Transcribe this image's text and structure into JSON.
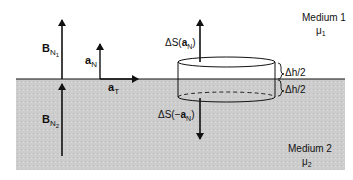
{
  "diagram": {
    "media": {
      "top": {
        "name": "Medium 1",
        "permeability": "μ",
        "subscript": "1"
      },
      "bottom": {
        "name": "Medium 2",
        "permeability": "μ",
        "subscript": "2"
      }
    },
    "vectors": {
      "b_n1": {
        "base": "B",
        "sub": "N",
        "subsub": "1"
      },
      "b_n2": {
        "base": "B",
        "sub": "N",
        "subsub": "2"
      },
      "a_n": {
        "base": "a",
        "sub": "N"
      },
      "a_t": {
        "base": "a",
        "sub": "T"
      },
      "ds_up": {
        "prefix": "ΔS(",
        "base": "a",
        "sub": "N",
        "suffix": ")"
      },
      "ds_down": {
        "prefix": "ΔS(−",
        "base": "a",
        "sub": "N",
        "suffix": ")"
      }
    },
    "dimensions": {
      "upper_half": "Δh/2",
      "lower_half": "Δh/2"
    },
    "colors": {
      "medium2_fill": "#cfcfcf",
      "line": "#111111",
      "background": "#ffffff"
    }
  }
}
